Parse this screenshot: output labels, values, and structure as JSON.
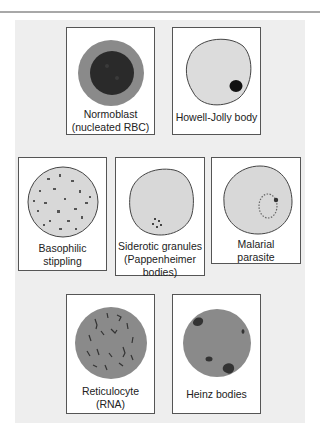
{
  "figure": {
    "colors": {
      "panel_bg": "#eeeeee",
      "card_bg": "#ffffff",
      "card_border": "#555555",
      "cell_light": "#d8d8d8",
      "cell_medium": "#8a8a8a",
      "nucleus_dark": "#2a2a2a",
      "inclusion": "#444444",
      "top_rule": "#a8a8a8"
    },
    "cells": [
      {
        "id": "normoblast",
        "label_line1": "Normoblast",
        "label_line2": "(nucleated RBC)",
        "icon": "nucleated-rbc-icon"
      },
      {
        "id": "howell_jolly",
        "label_line1": "Howell-Jolly body",
        "label_line2": "",
        "icon": "howell-jolly-body-icon"
      },
      {
        "id": "basophilic",
        "label_line1": "Basophilic",
        "label_line2": "stippling",
        "icon": "basophilic-stippling-icon"
      },
      {
        "id": "siderotic",
        "label_line1": "Siderotic granules",
        "label_line2": "(Pappenheimer",
        "label_line3": "bodies)",
        "icon": "siderotic-granules-icon"
      },
      {
        "id": "malarial",
        "label_line1": "Malarial",
        "label_line2": "parasite",
        "icon": "malarial-parasite-icon"
      },
      {
        "id": "reticulocyte",
        "label_line1": "Reticulocyte",
        "label_line2": "(RNA)",
        "icon": "reticulocyte-icon"
      },
      {
        "id": "heinz",
        "label_line1": "Heinz bodies",
        "label_line2": "",
        "icon": "heinz-bodies-icon"
      }
    ]
  }
}
